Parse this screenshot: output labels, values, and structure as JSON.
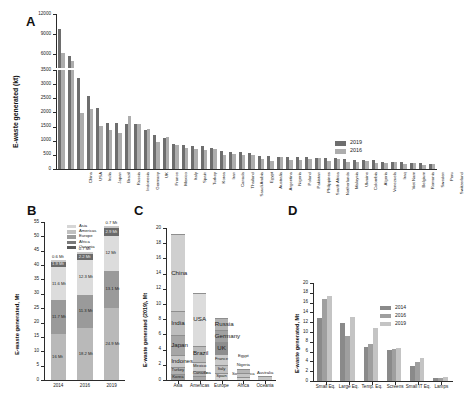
{
  "figure": {
    "panels": [
      "A",
      "B",
      "C",
      "D"
    ]
  },
  "panelA": {
    "label": "A",
    "ylabel": "E-waste generated (kt)",
    "upper_ticks": [
      "6000",
      "9000",
      "12000"
    ],
    "lower_ticks": [
      "0",
      "500",
      "1000",
      "1500",
      "2000",
      "2500",
      "3000",
      "3500"
    ],
    "legend": [
      {
        "name": "2019",
        "color": "#6e6e6e"
      },
      {
        "name": "2016",
        "color": "#adadad"
      }
    ],
    "chart_data": {
      "type": "bar",
      "title": "E-waste generated by country",
      "xlabel": "",
      "ylabel": "E-waste generated (kt)",
      "ylim": [
        0,
        12000
      ],
      "axis_break": [
        3500,
        6000
      ],
      "categories": [
        "China",
        "USA",
        "India",
        "Japan",
        "Brazil",
        "Russia",
        "Indonesia",
        "Germany",
        "UK",
        "France",
        "Mexico",
        "Italy",
        "Spain",
        "Turkey",
        "Korea",
        "Iran",
        "Canada",
        "Thailand",
        "Saudi Arabia",
        "Egypt",
        "Australia",
        "Argentina",
        "Nigeria",
        "Poland",
        "Pakistan",
        "Philippines",
        "South Africa",
        "Netherlands",
        "Malaysia",
        "Ukraine",
        "Colombia",
        "Algeria",
        "Venezuela",
        "Iraq",
        "Viet Nam",
        "Belgium",
        "Romania",
        "Sweden",
        "Peru",
        "Switzerland"
      ],
      "series": [
        {
          "name": "2019",
          "color": "#6e6e6e",
          "values": [
            10129,
            6918,
            3230,
            2569,
            2143,
            1631,
            1618,
            1607,
            1598,
            1362,
            1220,
            1105,
            888,
            846,
            818,
            804,
            757,
            653,
            595,
            586,
            554,
            465,
            461,
            436,
            433,
            425,
            416,
            399,
            383,
            378,
            340,
            327,
            324,
            309,
            257,
            249,
            248,
            216,
            214,
            190
          ]
        },
        {
          "name": "2016",
          "color": "#adadad",
          "values": [
            7211,
            6295,
            1975,
            2139,
            1534,
            1392,
            1274,
            1858,
            1593,
            1422,
            943,
            1133,
            865,
            730,
            698,
            670,
            725,
            510,
            539,
            511,
            487,
            368,
            277,
            432,
            334,
            303,
            361,
            396,
            296,
            340,
            261,
            240,
            278,
            212,
            198,
            241,
            170,
            214,
            159,
            184
          ]
        }
      ]
    }
  },
  "panelB": {
    "label": "B",
    "ylabel": "E-waste generated, Mt",
    "ticks": [
      "0",
      "5",
      "10",
      "15",
      "20",
      "25",
      "30",
      "35",
      "40",
      "45",
      "50",
      "55"
    ],
    "legend": [
      {
        "name": "Asia",
        "color": "#d6d6d6"
      },
      {
        "name": "Americas",
        "color": "#c0c0c0"
      },
      {
        "name": "Europe",
        "color": "#9b9b9b"
      },
      {
        "name": "Africa",
        "color": "#7a7a7a"
      },
      {
        "name": "Oceania",
        "color": "#5a5a5a"
      }
    ],
    "chart_data": {
      "type": "bar",
      "title": "E-waste generated by continent",
      "xlabel": "",
      "ylabel": "E-waste generated, Mt",
      "ylim": [
        0,
        55
      ],
      "stacked": true,
      "categories": [
        "2014",
        "2016",
        "2019"
      ],
      "series": [
        {
          "name": "Asia",
          "color": "#b9b9b9",
          "values": [
            16,
            18.2,
            24.9
          ],
          "labels": [
            "16 Mt",
            "18.2 Mt",
            "24.9 Mt"
          ]
        },
        {
          "name": "Americas",
          "color": "#9a9a9a",
          "values": [
            11.7,
            11.3,
            13.1
          ],
          "labels": [
            "11.7 Mt",
            "11.3 Mt",
            "13.1 Mt"
          ]
        },
        {
          "name": "Europe",
          "color": "#dcdcdc",
          "values": [
            11.6,
            12.3,
            12
          ],
          "labels": [
            "11.6 Mt",
            "12.3 Mt",
            "12 Mt"
          ]
        },
        {
          "name": "Africa",
          "color": "#6a6a6a",
          "values": [
            1.9,
            2.2,
            2.9
          ],
          "labels": [
            "1.9 Mt",
            "2.2 Mt",
            "2.9 Mt"
          ]
        },
        {
          "name": "Oceania",
          "color": "#c9c9c9",
          "values": [
            0.6,
            0.7,
            0.7
          ],
          "labels": [
            "0.6 Mt",
            "0.7 Mt",
            "0.7 Mt"
          ]
        }
      ]
    }
  },
  "panelC": {
    "label": "C",
    "ylabel": "E-waste generated (2019), Mt",
    "ticks": [
      "0",
      "2",
      "4",
      "6",
      "8",
      "10",
      "12",
      "14",
      "16",
      "18",
      "20"
    ],
    "chart_data": {
      "type": "bar",
      "title": "E-waste generated 2019 by region, top countries",
      "xlabel": "",
      "ylabel": "E-waste generated (2019), Mt",
      "ylim": [
        0,
        20
      ],
      "stacked": true,
      "categories": [
        "Asia",
        "Americas",
        "Europe",
        "Africa",
        "Oceania"
      ],
      "columns": [
        {
          "region": "Asia",
          "total": 19.1,
          "segments": [
            {
              "name": "China",
              "value": 10.1,
              "color": "#cfcfcf"
            },
            {
              "name": "India",
              "value": 3.2,
              "color": "#bdbdbd"
            },
            {
              "name": "Japan",
              "value": 2.6,
              "color": "#a6a6a6"
            },
            {
              "name": "Indonesia",
              "value": 1.6,
              "color": "#c7c7c7"
            },
            {
              "name": "Turkey",
              "value": 0.85,
              "color": "#b0b0b0"
            },
            {
              "name": "Korea",
              "value": 0.82,
              "color": "#9c9c9c"
            }
          ]
        },
        {
          "region": "Americas",
          "total": 11.2,
          "segments": [
            {
              "name": "USA",
              "value": 6.9,
              "color": "#dcdcdc"
            },
            {
              "name": "Brazil",
              "value": 2.1,
              "color": "#bbbbbb"
            },
            {
              "name": "Mexico",
              "value": 1.2,
              "color": "#cdcdcd"
            },
            {
              "name": "Canada",
              "value": 0.76,
              "color": "#b4b4b4"
            },
            {
              "name": "Argentina",
              "value": 0.47,
              "color": "#a8a8a8"
            }
          ]
        },
        {
          "region": "Europe",
          "total": 7.6,
          "segments": [
            {
              "name": "Russia",
              "value": 1.6,
              "color": "#b2b2b2"
            },
            {
              "name": "Germany",
              "value": 1.6,
              "color": "#a0a0a0"
            },
            {
              "name": "UK",
              "value": 1.6,
              "color": "#8d8d8d"
            },
            {
              "name": "France",
              "value": 1.4,
              "color": "#cacaca"
            },
            {
              "name": "Italy",
              "value": 1.1,
              "color": "#bebebe"
            },
            {
              "name": "Spain",
              "value": 0.89,
              "color": "#d2d2d2"
            }
          ]
        },
        {
          "region": "Africa",
          "total": 1.46,
          "segments": [
            {
              "name": "Egypt",
              "value": 0.59,
              "color": "#b5b5b5"
            },
            {
              "name": "Nigeria",
              "value": 0.46,
              "color": "#c4c4c4"
            },
            {
              "name": "South Africa",
              "value": 0.42,
              "color": "#d0d0d0"
            }
          ]
        },
        {
          "region": "Oceania",
          "total": 0.55,
          "segments": [
            {
              "name": "Australia",
              "value": 0.55,
              "color": "#c6c6c6"
            }
          ]
        }
      ]
    }
  },
  "panelD": {
    "label": "D",
    "ylabel": "E-waste generated, Mt",
    "ticks": [
      "0",
      "2",
      "4",
      "6",
      "8",
      "10",
      "12",
      "14",
      "16",
      "18",
      "20"
    ],
    "legend": [
      {
        "name": "2014",
        "color": "#8a8a8a"
      },
      {
        "name": "2016",
        "color": "#9f9f9f"
      },
      {
        "name": "2019",
        "color": "#c4c4c4"
      }
    ],
    "chart_data": {
      "type": "bar",
      "title": "E-waste generated by equipment category",
      "xlabel": "",
      "ylabel": "E-waste generated, Mt",
      "ylim": [
        0,
        20
      ],
      "categories": [
        "Small Eq.",
        "Large Eq.",
        "Temp. Eq.",
        "Screens",
        "Small IT Eq.",
        "Lamps"
      ],
      "series": [
        {
          "name": "2014",
          "color": "#8a8a8a",
          "values": [
            12.8,
            11.8,
            6.9,
            6.3,
            3.0,
            0.6
          ]
        },
        {
          "name": "2016",
          "color": "#9f9f9f",
          "values": [
            16.8,
            9.1,
            7.6,
            6.6,
            3.9,
            0.7
          ]
        },
        {
          "name": "2019",
          "color": "#c4c4c4",
          "values": [
            17.4,
            13.1,
            10.8,
            6.7,
            4.7,
            0.9
          ]
        }
      ]
    }
  }
}
